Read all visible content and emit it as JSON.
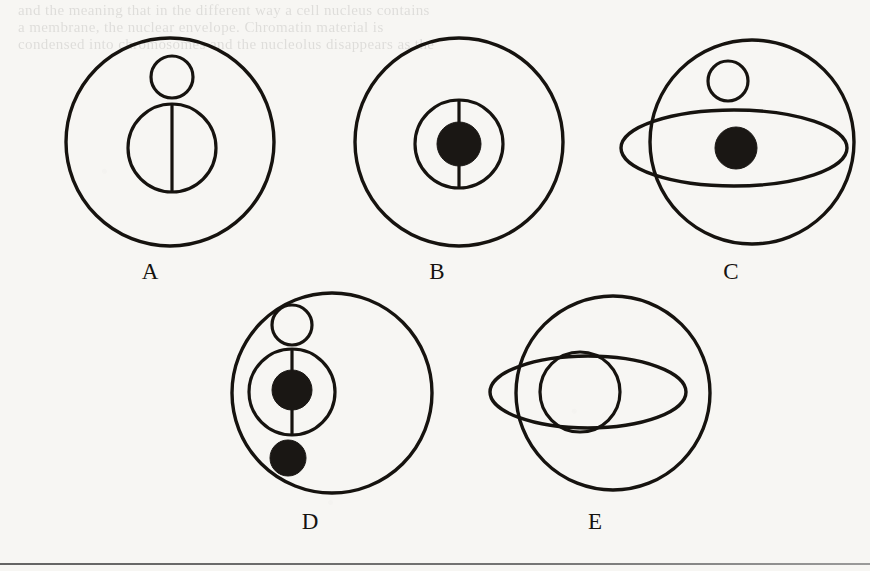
{
  "page": {
    "background_color": "#f7f6f3",
    "ink_color": "#16130f",
    "fill_color": "#1a1714",
    "rule_color": "#4a4a4a"
  },
  "bleed_through": {
    "line1": "and the meaning that in the different way a cell nucleus contains",
    "line2": "a membrane, the nuclear envelope. Chromatin material is",
    "line3": "condensed into chromosomes and the nucleolus disappears as the",
    "line4": "spindle forms between the two separating centriole pairs."
  },
  "figures": [
    {
      "id": "figure-a",
      "label": "A",
      "label_x": 150,
      "label_y": 279,
      "outer_circle": {
        "cx": 170,
        "cy": 142,
        "r": 104,
        "fill": "none"
      },
      "small_circle": {
        "cx": 172,
        "cy": 77,
        "r": 21,
        "fill": "none"
      },
      "mid_circle": {
        "cx": 172,
        "cy": 148,
        "r": 44,
        "fill": "none"
      },
      "vertical_line": {
        "x": 172,
        "y1": 104,
        "y2": 192
      },
      "dots": [],
      "ellipse": null
    },
    {
      "id": "figure-b",
      "label": "B",
      "label_x": 437,
      "label_y": 279,
      "outer_circle": {
        "cx": 459,
        "cy": 142,
        "r": 104,
        "fill": "none"
      },
      "small_circle": null,
      "mid_circle": {
        "cx": 459,
        "cy": 144,
        "r": 44,
        "fill": "none"
      },
      "vertical_line": {
        "x": 459,
        "y1": 100,
        "y2": 188
      },
      "dots": [
        {
          "cx": 459,
          "cy": 144,
          "r": 22,
          "fill": "solid"
        }
      ],
      "ellipse": null
    },
    {
      "id": "figure-c",
      "label": "C",
      "label_x": 731,
      "label_y": 279,
      "outer_circle": {
        "cx": 752,
        "cy": 142,
        "r": 102,
        "fill": "none"
      },
      "small_circle": {
        "cx": 728,
        "cy": 81,
        "r": 20,
        "fill": "none"
      },
      "mid_circle": null,
      "vertical_line": null,
      "dots": [
        {
          "cx": 736,
          "cy": 148,
          "r": 21,
          "fill": "solid"
        }
      ],
      "ellipse": {
        "cx": 734,
        "cy": 148,
        "rx": 113,
        "ry": 38
      }
    },
    {
      "id": "figure-d",
      "label": "D",
      "label_x": 310,
      "label_y": 529,
      "outer_circle": {
        "cx": 332,
        "cy": 393,
        "r": 100,
        "fill": "none"
      },
      "small_circle": {
        "cx": 292,
        "cy": 325,
        "r": 20,
        "fill": "none"
      },
      "mid_circle": {
        "cx": 292,
        "cy": 392,
        "r": 43,
        "fill": "none"
      },
      "vertical_line": {
        "x": 292,
        "y1": 349,
        "y2": 435
      },
      "dots": [
        {
          "cx": 292,
          "cy": 390,
          "r": 20,
          "fill": "solid"
        },
        {
          "cx": 288,
          "cy": 458,
          "r": 18,
          "fill": "solid"
        }
      ],
      "ellipse": null
    },
    {
      "id": "figure-e",
      "label": "E",
      "label_x": 595,
      "label_y": 529,
      "outer_circle": {
        "cx": 613,
        "cy": 393,
        "r": 97,
        "fill": "none"
      },
      "small_circle": null,
      "mid_circle": {
        "cx": 580,
        "cy": 392,
        "r": 40,
        "fill": "none"
      },
      "vertical_line": null,
      "dots": [],
      "ellipse": {
        "cx": 588,
        "cy": 392,
        "rx": 98,
        "ry": 36
      }
    }
  ]
}
